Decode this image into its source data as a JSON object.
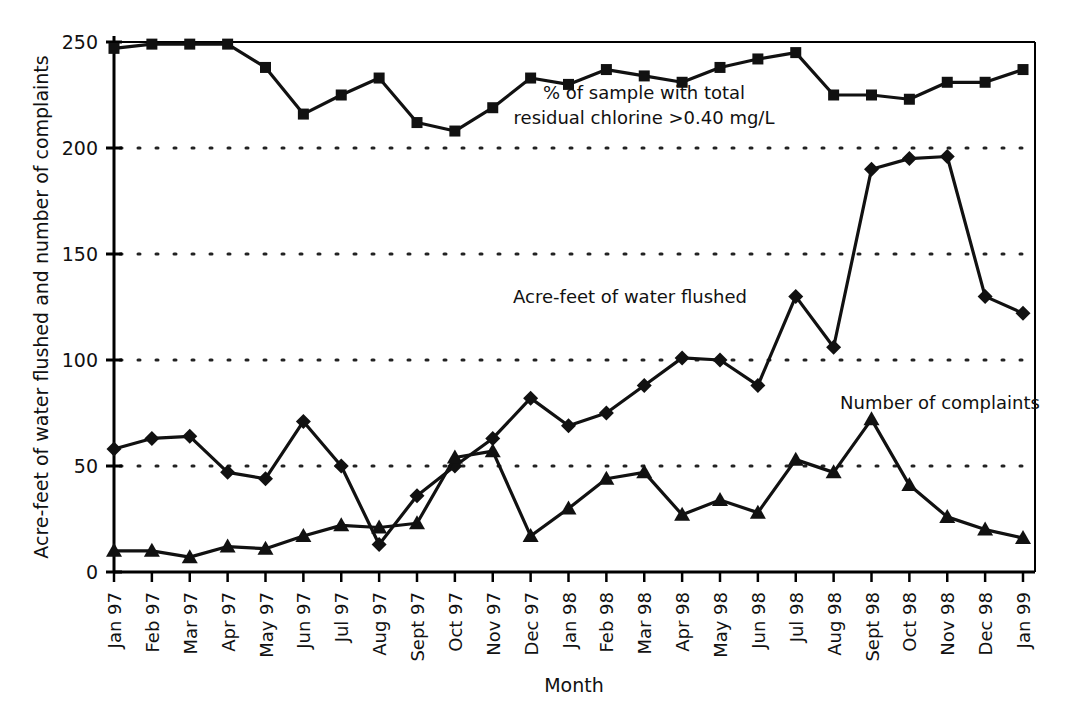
{
  "chart_data": {
    "type": "line",
    "title": "",
    "xlabel": "Month",
    "ylabel": "Acre-feet of water flushed and number of complaints",
    "ylim": [
      0,
      250
    ],
    "yticks": [
      0,
      50,
      100,
      150,
      200,
      250
    ],
    "ytick_labels": [
      "0",
      "50",
      "100",
      "150",
      "200",
      "250"
    ],
    "grid": "horizontal-dotted",
    "legend_position": "inline-annotations",
    "categories": [
      "Jan 97",
      "Feb 97",
      "Mar 97",
      "Apr 97",
      "May 97",
      "Jun 97",
      "Jul 97",
      "Aug 97",
      "Sept 97",
      "Oct 97",
      "Nov 97",
      "Dec 97",
      "Jan 98",
      "Feb 98",
      "Mar 98",
      "Apr 98",
      "May 98",
      "Jun 98",
      "Jul 98",
      "Aug 98",
      "Sept 98",
      "Oct 98",
      "Nov 98",
      "Dec 98",
      "Jan 99"
    ],
    "series": [
      {
        "name": "% of sample with total residual chlorine >0.40 mg/L",
        "marker": "square",
        "values": [
          247,
          249,
          249,
          249,
          238,
          216,
          225,
          233,
          212,
          208,
          219,
          233,
          230,
          237,
          234,
          231,
          238,
          242,
          245,
          225,
          225,
          223,
          231,
          231,
          237
        ]
      },
      {
        "name": "Acre-feet of water flushed",
        "marker": "diamond",
        "values": [
          58,
          63,
          64,
          47,
          44,
          71,
          50,
          13,
          36,
          50,
          63,
          82,
          69,
          75,
          88,
          101,
          100,
          88,
          130,
          106,
          190,
          195,
          196,
          130,
          122
        ]
      },
      {
        "name": "Number of complaints",
        "marker": "triangle",
        "values": [
          10,
          10,
          7,
          12,
          11,
          17,
          22,
          21,
          23,
          54,
          57,
          17,
          30,
          44,
          47,
          27,
          34,
          28,
          53,
          47,
          72,
          41,
          26,
          20,
          16
        ]
      }
    ],
    "annotations": [
      {
        "id": "annot-chlorine",
        "lines": [
          "% of sample with total",
          "residual chlorine >0.40 mg/L"
        ]
      },
      {
        "id": "annot-acrefeet",
        "lines": [
          "Acre-feet of water flushed"
        ]
      },
      {
        "id": "annot-complaints",
        "lines": [
          "Number of complaints"
        ]
      }
    ],
    "colors": {
      "line": "#111111",
      "grid": "#222222",
      "axis": "#000000",
      "background": "#ffffff"
    }
  }
}
